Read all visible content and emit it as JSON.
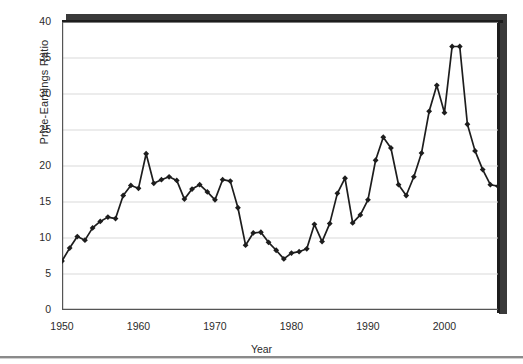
{
  "chart_data": {
    "type": "line",
    "title": "",
    "subtitle": "",
    "xlabel": "Year",
    "ylabel": "Price-Earnings Ratio",
    "xlim": [
      1950,
      2007
    ],
    "ylim": [
      0,
      40
    ],
    "xticks": [
      1950,
      1960,
      1970,
      1980,
      1990,
      2000
    ],
    "xtick_labels": [
      "1950",
      "1960",
      "1970",
      "1980",
      "1990",
      "2000"
    ],
    "xtick_minor_interval": 1,
    "yticks": [
      0,
      5,
      10,
      15,
      20,
      25,
      30,
      35,
      40
    ],
    "ytick_labels": [
      "0",
      "5",
      "10",
      "15",
      "20",
      "25",
      "30",
      "35",
      "40"
    ],
    "grid": "horizontal",
    "legend": "none",
    "marker": "diamond",
    "line_color": "#1d1d1d",
    "marker_color": "#1d1d1d",
    "grid_color": "#d9d9d9",
    "axis_color": "#555555",
    "background": "#ffffff",
    "x": [
      1950,
      1951,
      1952,
      1953,
      1954,
      1955,
      1956,
      1957,
      1958,
      1959,
      1960,
      1961,
      1962,
      1963,
      1964,
      1965,
      1966,
      1967,
      1968,
      1969,
      1970,
      1971,
      1972,
      1973,
      1974,
      1975,
      1976,
      1977,
      1978,
      1979,
      1980,
      1981,
      1982,
      1983,
      1984,
      1985,
      1986,
      1987,
      1988,
      1989,
      1990,
      1991,
      1992,
      1993,
      1994,
      1995,
      1996,
      1997,
      1998,
      1999,
      2000,
      2001,
      2002,
      2003,
      2004,
      2005,
      2006,
      2007
    ],
    "series": [
      {
        "name": "Price-Earnings Ratio",
        "values": [
          6.8,
          8.6,
          10.2,
          9.7,
          11.4,
          12.3,
          12.9,
          12.7,
          15.9,
          17.3,
          16.9,
          21.7,
          17.6,
          18.1,
          18.5,
          18.0,
          15.4,
          16.8,
          17.4,
          16.4,
          15.3,
          18.1,
          17.9,
          14.2,
          9.0,
          10.7,
          10.8,
          9.4,
          8.3,
          7.1,
          7.9,
          8.1,
          8.5,
          11.9,
          9.5,
          12.0,
          16.2,
          18.3,
          12.1,
          13.2,
          15.3,
          20.8,
          24.0,
          22.5,
          17.4,
          15.9,
          18.5,
          21.8,
          27.6,
          31.2,
          27.4,
          36.6,
          36.6,
          25.8,
          22.1,
          19.5,
          17.4,
          17.2
        ]
      }
    ]
  },
  "axes": {
    "y_title": "Price-Earnings Ratio",
    "x_title": "Year"
  }
}
